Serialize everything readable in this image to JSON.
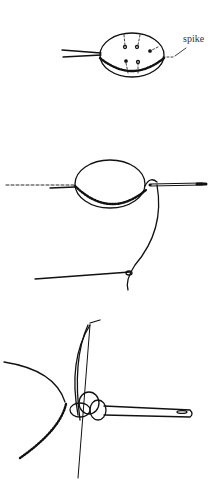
{
  "figure": {
    "panels": [
      {
        "id": "step-1",
        "label": "spike"
      },
      {
        "id": "step-2"
      },
      {
        "id": "step-3"
      }
    ]
  }
}
